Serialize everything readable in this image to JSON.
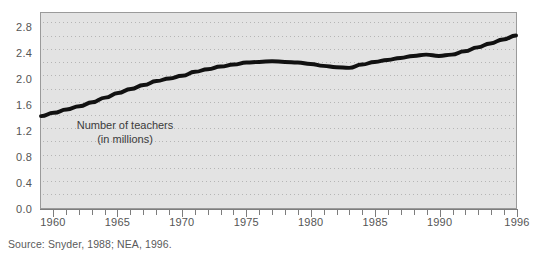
{
  "chart_data": {
    "type": "line",
    "title": "",
    "xlabel": "",
    "ylabel": "",
    "annotation": "Number of teachers (in millions)",
    "annotation_line1": "Number of teachers",
    "annotation_line2": "(in millions)",
    "source": "Source: Snyder, 1988; NEA, 1996.",
    "grid": true,
    "grid_style": "dotted",
    "legend": "none",
    "xlim": [
      1959,
      1996
    ],
    "ylim": [
      0.0,
      2.95
    ],
    "ytick_labels": [
      "0.0",
      "0.4",
      "0.8",
      "1.2",
      "1.6",
      "2.0",
      "2.4",
      "2.8"
    ],
    "yticks": [
      0.0,
      0.4,
      0.8,
      1.2,
      1.6,
      2.0,
      2.4,
      2.8
    ],
    "xtick_labels": [
      "1960",
      "1965",
      "1970",
      "1975",
      "1980",
      "1985",
      "1990",
      "1996"
    ],
    "xticks": [
      1960,
      1965,
      1970,
      1975,
      1980,
      1985,
      1990,
      1996
    ],
    "xtick_minor_step": 1,
    "line_color": "#111111",
    "line_width": 4,
    "plot_background": "#e3e3e3",
    "x": [
      1959,
      1960,
      1961,
      1962,
      1963,
      1964,
      1965,
      1966,
      1967,
      1968,
      1969,
      1970,
      1971,
      1972,
      1973,
      1974,
      1975,
      1976,
      1977,
      1978,
      1979,
      1980,
      1981,
      1982,
      1983,
      1984,
      1985,
      1986,
      1987,
      1988,
      1989,
      1990,
      1991,
      1992,
      1993,
      1994,
      1995,
      1996
    ],
    "values": [
      1.39,
      1.44,
      1.49,
      1.54,
      1.6,
      1.67,
      1.74,
      1.8,
      1.86,
      1.92,
      1.96,
      2.0,
      2.06,
      2.1,
      2.14,
      2.17,
      2.2,
      2.21,
      2.22,
      2.21,
      2.2,
      2.18,
      2.15,
      2.13,
      2.12,
      2.17,
      2.21,
      2.24,
      2.27,
      2.3,
      2.32,
      2.3,
      2.32,
      2.37,
      2.43,
      2.49,
      2.55,
      2.61
    ],
    "series_name": "Number of teachers (in millions)"
  }
}
